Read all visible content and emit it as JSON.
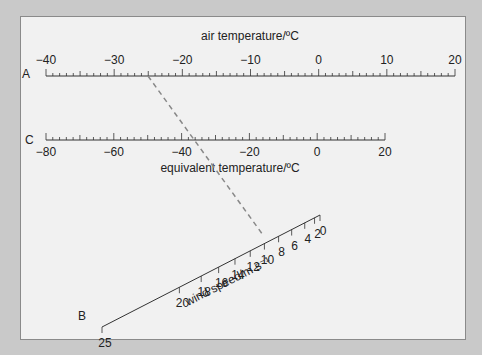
{
  "diagram": {
    "type": "nomogram",
    "scale_a": {
      "letter": "A",
      "title": "air temperature/ºC",
      "min": -40,
      "max": 20,
      "major_labels": [
        "−40",
        "−30",
        "−20",
        "−10",
        "0",
        "10",
        "20"
      ],
      "major_values": [
        -40,
        -30,
        -20,
        -10,
        0,
        10,
        20
      ]
    },
    "scale_c": {
      "letter": "C",
      "title": "equivalent temperature/ºC",
      "min": -80,
      "max": 20,
      "major_labels": [
        "−80",
        "−60",
        "−40",
        "−20",
        "0",
        "20"
      ],
      "major_values": [
        -80,
        -60,
        -40,
        -20,
        0,
        20
      ]
    },
    "scale_b": {
      "letter": "B",
      "title": "wind speed/m s⁻¹",
      "labels": [
        "25",
        "20",
        "18",
        "16",
        "14",
        "12",
        "10",
        "8",
        "6",
        "4",
        "2",
        "0"
      ],
      "values": [
        25,
        20,
        18,
        16,
        14,
        12,
        10,
        8,
        6,
        4,
        2,
        0
      ]
    },
    "example_line": {
      "style": "dashed",
      "air_temperature": -25,
      "wind_speed": 8,
      "equivalent_temperature": -35
    }
  }
}
